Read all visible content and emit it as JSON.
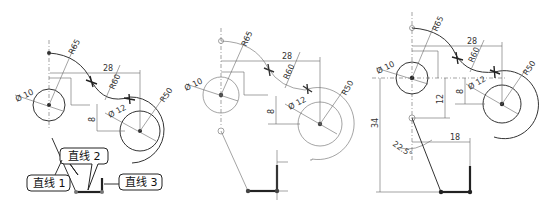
{
  "figure": {
    "panels": [
      {
        "id": "panel-1",
        "dimensions": {
          "arc_r_top": "R65",
          "horiz_28": "28",
          "arc_r_mid": "R60",
          "arc_r_right": "R50",
          "dia_left": "Ø 10",
          "dia_right": "Ø 12",
          "vert_8": "8"
        },
        "callouts": [
          {
            "label": "直线 1"
          },
          {
            "label": "直线 2"
          },
          {
            "label": "直线 3"
          }
        ]
      },
      {
        "id": "panel-2",
        "dimensions": {
          "arc_r_top": "R65",
          "horiz_28": "28",
          "arc_r_mid": "R60",
          "arc_r_right": "R50",
          "dia_left": "Ø 10",
          "dia_right": "Ø 12",
          "vert_8": "8"
        }
      },
      {
        "id": "panel-3",
        "dimensions": {
          "arc_r_top": "R65",
          "horiz_28": "28",
          "arc_r_mid": "R60",
          "arc_r_right": "R50",
          "dia_left": "Ø 10",
          "dia_right": "Ø 12",
          "vert_8": "8",
          "vert_12": "12",
          "vert_34": "34",
          "horiz_18": "18",
          "angle": "22.5°"
        }
      }
    ]
  }
}
